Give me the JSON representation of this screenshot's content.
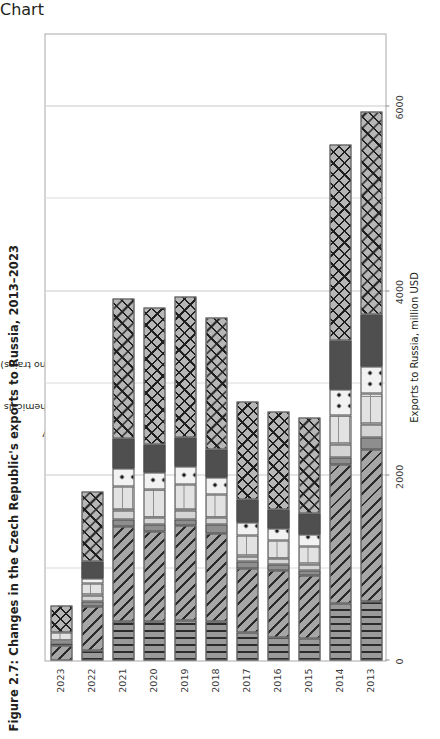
{
  "figure": {
    "title": "Figure 2.7: Changes in the Czech Republic's exports to Russia, 2013–2023",
    "legend_title": "Category"
  },
  "chart_data": {
    "type": "bar",
    "orientation": "vertical",
    "stacked": true,
    "title": "Figure 2.7: Changes in the Czech Republic's exports to Russia, 2013–2023",
    "xlabel": "",
    "ylabel": "Exports to Russia, million USD",
    "ylim": [
      0,
      6800
    ],
    "yticks": [
      "0",
      "2000",
      "4000",
      "6000"
    ],
    "ytick_values": [
      0,
      2000,
      4000,
      6000
    ],
    "grid": "y-major vertical gridlines",
    "legend_position": "above plot, centre-left",
    "categories": [
      "2013",
      "2014",
      "2015",
      "2016",
      "2017",
      "2018",
      "2019",
      "2020",
      "2021",
      "2022",
      "2023"
    ],
    "series": [
      {
        "name": "Electrics",
        "pattern": "vertical-lines",
        "color": "#9a9a9a",
        "values": [
          640,
          620,
          240,
          250,
          300,
          420,
          430,
          420,
          420,
          110,
          0
        ]
      },
      {
        "name": "Machinery",
        "pattern": "diagonal-lines",
        "color": "#a6a6a6",
        "values": [
          1640,
          1500,
          680,
          730,
          700,
          960,
          1030,
          980,
          1030,
          480,
          160
        ]
      },
      {
        "name": "Optics",
        "pattern": "solid-dark-grey",
        "color": "#8e8e8e",
        "values": [
          130,
          80,
          60,
          60,
          70,
          90,
          70,
          70,
          80,
          50,
          20
        ]
      },
      {
        "name": "Organic chemicals",
        "pattern": "solid-light-grey",
        "color": "#d4d4d4",
        "values": [
          150,
          140,
          60,
          60,
          60,
          80,
          90,
          80,
          90,
          60,
          30
        ]
      },
      {
        "name": "Pharma",
        "pattern": "grid-lines",
        "color": "#e2e2e2",
        "values": [
          330,
          310,
          200,
          200,
          220,
          250,
          290,
          300,
          260,
          130,
          90
        ]
      },
      {
        "name": "Plastics",
        "pattern": "polka-dots",
        "color": "#f2f2f2",
        "values": [
          290,
          280,
          130,
          130,
          150,
          180,
          190,
          190,
          200,
          60,
          0
        ]
      },
      {
        "name": "Vehicles (no trains)",
        "pattern": "solid-charcoal",
        "color": "#4f4f4f",
        "values": [
          570,
          540,
          220,
          210,
          240,
          300,
          320,
          300,
          320,
          180,
          0
        ]
      },
      {
        "name": "Other",
        "pattern": "cross-hatch",
        "color": "#b6b6b6",
        "values": [
          2200,
          2120,
          1040,
          1060,
          1060,
          1440,
          1520,
          1480,
          1520,
          760,
          290
        ]
      }
    ],
    "totals": [
      5950,
      5590,
      2630,
      2700,
      2800,
      3720,
      3940,
      3820,
      3920,
      1830,
      590
    ]
  }
}
